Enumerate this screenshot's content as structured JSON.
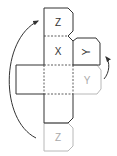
{
  "diagram": {
    "type": "cube-net-folding",
    "colors": {
      "line": "#333333",
      "ghost": "#b8b8b8",
      "text": "#333333",
      "ghost_text": "#aaaaaa"
    },
    "faces": {
      "top": {
        "label": "Z"
      },
      "middle": {
        "label": "X"
      },
      "right_folded": {
        "label": "Y"
      },
      "right_ghost": {
        "label": "Y"
      },
      "bottom_ghost": {
        "label": "Z"
      }
    }
  }
}
